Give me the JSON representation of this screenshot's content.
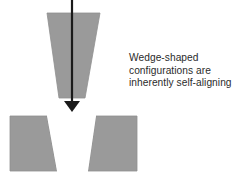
{
  "figure": {
    "name": "wedge-shaped-self-aligning-diagram",
    "background_color": "#ffffff",
    "part_fill_color": "#9a9a9a",
    "part_outline_color": "#8f8f8f",
    "notch_fill_color": "#ffffff",
    "arrow_color": "#1a1a1a",
    "text_color": "#2b2b2b"
  },
  "caption": {
    "line1": "Wedge-shaped",
    "line2": "configurations are",
    "line3": "inherently self-aligning"
  },
  "shapes": {
    "upper_wedge": {
      "label": "upper-wedge-part",
      "points": "47,13 100,13 85,98 59,98"
    },
    "lower_block_left": {
      "label": "lower-block-left-half",
      "points": "10,116 47,116 57,171 10,171"
    },
    "lower_block_right": {
      "label": "lower-block-right-half",
      "points": "96,116 137,116 137,171 88,171"
    },
    "notch": {
      "label": "v-notch-cavity",
      "points": "47,116 96,116 88,171 57,171"
    },
    "arrow": {
      "label": "downward-insertion-arrow",
      "shaft_x": 72,
      "shaft_top_y": 0,
      "shaft_bottom_y": 103,
      "shaft_width": 2.2,
      "head_points": "64,101 80,101 72,112"
    }
  }
}
